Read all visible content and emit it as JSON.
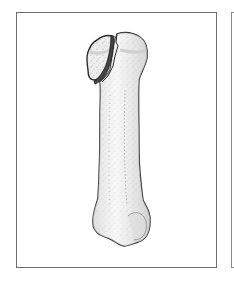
{
  "figure": {
    "fill_color": "#ececec",
    "outline_color": "#2a2a2a",
    "frame_color": "#6e6e6e",
    "fracture_color": "#444444"
  }
}
